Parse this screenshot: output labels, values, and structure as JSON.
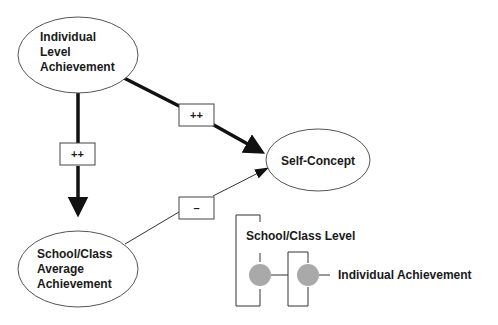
{
  "nodes": {
    "individual": {
      "lines": [
        "Individual",
        "Level",
        "Achievement"
      ]
    },
    "school": {
      "lines": [
        "School/Class",
        "Average",
        "Achievement"
      ]
    },
    "self_concept": {
      "label": "Self-Concept"
    }
  },
  "edges": {
    "individual_to_school": {
      "sign": "++"
    },
    "individual_to_self": {
      "sign": "++"
    },
    "school_to_self": {
      "sign": "–"
    }
  },
  "legend": {
    "outer_label": "School/Class Level",
    "inner_label": "Individual Achievement"
  },
  "colors": {
    "stroke": "#1a1a1a",
    "circle_fill": "#a9a9a9",
    "background": "#ffffff"
  }
}
